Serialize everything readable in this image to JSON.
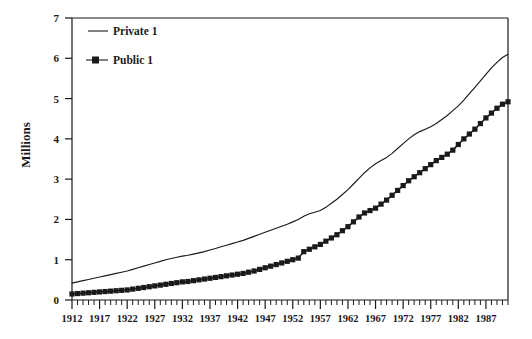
{
  "chart_data": {
    "type": "line",
    "title": "",
    "xlabel": "",
    "ylabel": "Millions",
    "xlim": [
      1912,
      1991
    ],
    "ylim": [
      0,
      7
    ],
    "grid": false,
    "legend_position": "top-left inside",
    "y_ticks": [
      0,
      1,
      2,
      3,
      4,
      5,
      6,
      7
    ],
    "y_tick_labels": [
      "0",
      "1",
      "2",
      "3",
      "4",
      "5",
      "6",
      "7"
    ],
    "x_ticks": [
      1912,
      1917,
      1922,
      1927,
      1932,
      1937,
      1942,
      1947,
      1952,
      1957,
      1962,
      1967,
      1972,
      1977,
      1982,
      1987
    ],
    "x_tick_labels": [
      "1912",
      "1917",
      "1922",
      "1927",
      "1932",
      "1937",
      "1942",
      "1947",
      "1952",
      "1957",
      "1962",
      "1967",
      "1972",
      "1977",
      "1982",
      "1987"
    ],
    "x_minor_tick_interval": 1,
    "x": [
      1912,
      1913,
      1914,
      1915,
      1916,
      1917,
      1918,
      1919,
      1920,
      1921,
      1922,
      1923,
      1924,
      1925,
      1926,
      1927,
      1928,
      1929,
      1930,
      1931,
      1932,
      1933,
      1934,
      1935,
      1936,
      1937,
      1938,
      1939,
      1940,
      1941,
      1942,
      1943,
      1944,
      1945,
      1946,
      1947,
      1948,
      1949,
      1950,
      1951,
      1952,
      1953,
      1954,
      1955,
      1956,
      1957,
      1958,
      1959,
      1960,
      1961,
      1962,
      1963,
      1964,
      1965,
      1966,
      1967,
      1968,
      1969,
      1970,
      1971,
      1972,
      1973,
      1974,
      1975,
      1976,
      1977,
      1978,
      1979,
      1980,
      1981,
      1982,
      1983,
      1984,
      1985,
      1986,
      1987,
      1988,
      1989,
      1990,
      1991
    ],
    "series": [
      {
        "name": "Private 1",
        "marker": "none",
        "line_style": "solid",
        "color": "#1a1a1a",
        "values": [
          0.42,
          0.45,
          0.48,
          0.51,
          0.54,
          0.57,
          0.6,
          0.63,
          0.66,
          0.69,
          0.72,
          0.76,
          0.8,
          0.84,
          0.88,
          0.92,
          0.96,
          1.0,
          1.03,
          1.06,
          1.09,
          1.11,
          1.14,
          1.17,
          1.2,
          1.24,
          1.28,
          1.32,
          1.36,
          1.4,
          1.44,
          1.48,
          1.53,
          1.58,
          1.63,
          1.68,
          1.73,
          1.78,
          1.83,
          1.88,
          1.94,
          2.0,
          2.08,
          2.14,
          2.18,
          2.22,
          2.3,
          2.4,
          2.5,
          2.62,
          2.74,
          2.88,
          3.02,
          3.16,
          3.28,
          3.38,
          3.46,
          3.54,
          3.64,
          3.76,
          3.88,
          4.0,
          4.1,
          4.18,
          4.24,
          4.3,
          4.38,
          4.48,
          4.58,
          4.7,
          4.82,
          4.96,
          5.12,
          5.28,
          5.44,
          5.6,
          5.76,
          5.9,
          6.02,
          6.1
        ]
      },
      {
        "name": "Public 1",
        "marker": "filled-square",
        "line_style": "solid",
        "color": "#1a1a1a",
        "values": [
          0.15,
          0.16,
          0.17,
          0.18,
          0.19,
          0.2,
          0.21,
          0.22,
          0.23,
          0.24,
          0.25,
          0.27,
          0.29,
          0.31,
          0.33,
          0.35,
          0.37,
          0.39,
          0.41,
          0.43,
          0.45,
          0.46,
          0.48,
          0.5,
          0.52,
          0.54,
          0.56,
          0.58,
          0.6,
          0.62,
          0.64,
          0.66,
          0.69,
          0.72,
          0.76,
          0.8,
          0.84,
          0.88,
          0.92,
          0.96,
          1.0,
          1.04,
          1.2,
          1.26,
          1.32,
          1.38,
          1.46,
          1.54,
          1.62,
          1.72,
          1.82,
          1.94,
          2.06,
          2.16,
          2.22,
          2.28,
          2.38,
          2.48,
          2.6,
          2.72,
          2.84,
          2.96,
          3.06,
          3.16,
          3.26,
          3.36,
          3.46,
          3.54,
          3.62,
          3.72,
          3.86,
          4.0,
          4.12,
          4.24,
          4.38,
          4.52,
          4.64,
          4.76,
          4.86,
          4.92
        ]
      }
    ],
    "legend": [
      {
        "label": "Private 1",
        "marker": "none"
      },
      {
        "label": "Public 1",
        "marker": "filled-square"
      }
    ]
  }
}
